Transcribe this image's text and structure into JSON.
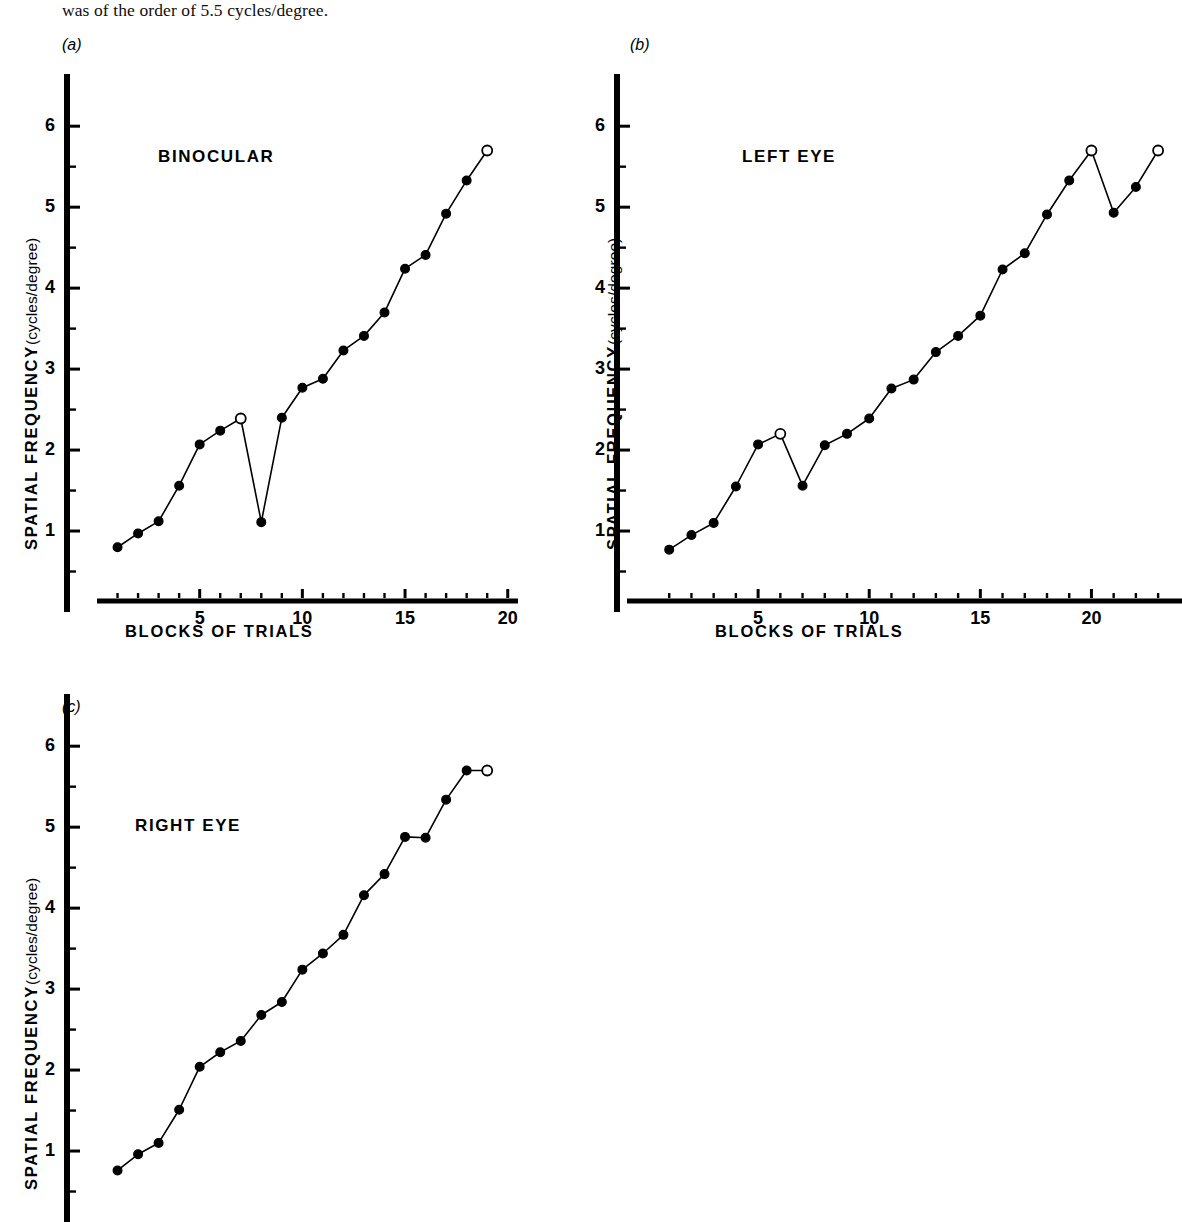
{
  "header": {
    "text": "was of the order of 5.5 cycles/degree."
  },
  "axis_titles": {
    "y_strong": "SPATIAL  FREQUENCY",
    "y_light": "(cycles/degree)",
    "x": "BLOCKS  OF  TRIALS"
  },
  "panels": [
    {
      "id": "a",
      "label": "(a)",
      "title": "BINOCULAR"
    },
    {
      "id": "b",
      "label": "(b)",
      "title": "LEFT   EYE"
    },
    {
      "id": "c",
      "label": "(c)",
      "title": "RIGHT   EYE"
    }
  ],
  "chart_data": [
    {
      "type": "line",
      "panel": "a",
      "title": "BINOCULAR",
      "xlabel": "BLOCKS OF TRIALS",
      "ylabel": "SPATIAL FREQUENCY (cycles/degree)",
      "xlim": [
        0,
        20.5
      ],
      "ylim": [
        0,
        6.2
      ],
      "xticks": [
        5,
        10,
        15,
        20
      ],
      "yticks": [
        1,
        2,
        3,
        4,
        5,
        6
      ],
      "xminor_step": 1,
      "yminor_step": 0.5,
      "grid": false,
      "legend": "none",
      "x": [
        1,
        2,
        3,
        4,
        5,
        6,
        7,
        8,
        9,
        10,
        11,
        12,
        13,
        14,
        15,
        16,
        17,
        18,
        19
      ],
      "values": [
        0.8,
        0.97,
        1.12,
        1.56,
        2.07,
        2.24,
        2.39,
        1.11,
        2.4,
        2.77,
        2.88,
        3.23,
        3.41,
        3.7,
        4.24,
        4.41,
        4.92,
        5.33,
        5.7
      ],
      "open_markers": [
        7,
        19
      ]
    },
    {
      "type": "line",
      "panel": "b",
      "title": "LEFT EYE",
      "xlabel": "BLOCKS OF TRIALS",
      "ylabel": "SPATIAL FREQUENCY (cycles/degree)",
      "xlim": [
        0,
        23.4
      ],
      "ylim": [
        0,
        6.2
      ],
      "xticks": [
        5,
        10,
        15,
        20
      ],
      "yticks": [
        1,
        2,
        3,
        4,
        5,
        6
      ],
      "xminor_step": 1,
      "yminor_step": 0.5,
      "grid": false,
      "legend": "none",
      "x": [
        1,
        2,
        3,
        4,
        5,
        6,
        7,
        8,
        9,
        10,
        11,
        12,
        13,
        14,
        15,
        16,
        17,
        18,
        19,
        20,
        21,
        22,
        23
      ],
      "values": [
        0.77,
        0.95,
        1.1,
        1.55,
        2.07,
        2.2,
        1.56,
        2.06,
        2.2,
        2.39,
        2.76,
        2.87,
        3.21,
        3.41,
        3.66,
        4.23,
        4.43,
        4.91,
        5.33,
        5.7,
        4.93,
        5.25,
        5.7
      ],
      "open_markers": [
        6,
        20,
        23
      ]
    },
    {
      "type": "line",
      "panel": "c",
      "title": "RIGHT EYE",
      "xlabel": "BLOCKS OF TRIALS",
      "ylabel": "SPATIAL FREQUENCY (cycles/degree)",
      "xlim": [
        0,
        20.5
      ],
      "ylim": [
        0,
        6.2
      ],
      "xticks": [],
      "yticks": [
        1,
        2,
        3,
        4,
        5,
        6
      ],
      "xminor_step": 1,
      "yminor_step": 0.5,
      "grid": false,
      "legend": "none",
      "clipped_bottom": true,
      "x": [
        1,
        2,
        3,
        4,
        5,
        6,
        7,
        8,
        9,
        10,
        11,
        12,
        13,
        14,
        15,
        16,
        17,
        18,
        19
      ],
      "values": [
        0.76,
        0.96,
        1.1,
        1.51,
        2.04,
        2.22,
        2.36,
        2.68,
        2.84,
        3.24,
        3.44,
        3.67,
        4.16,
        4.42,
        4.88,
        4.87,
        5.34,
        5.7,
        5.7
      ],
      "open_markers": [
        19
      ]
    }
  ]
}
